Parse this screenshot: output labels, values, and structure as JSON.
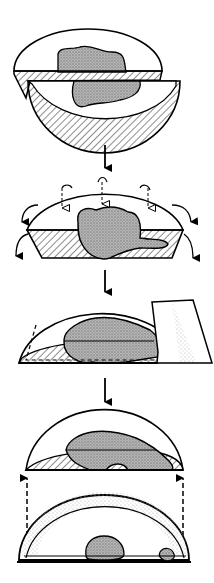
{
  "diagram": {
    "type": "process-illustration",
    "stages": [
      {
        "id": 1,
        "description": "hemisphere cut, top dome separated from bowl with hatched cut faces and stippled lesion"
      },
      {
        "id": 2,
        "description": "dome with truncated hatched base, dashed arrows pointing down, curved arrows spreading outward"
      },
      {
        "id": 3,
        "description": "dome flattened with blade cutting along base, dashed line inside"
      },
      {
        "id": 4,
        "description": "resulting flat section above, dashed upward arrows from lower hemispherical shell with stippled inner surface"
      }
    ],
    "colors": {
      "stroke": "#000000",
      "stipple": "#9a9a9a",
      "background": "#ffffff"
    }
  }
}
